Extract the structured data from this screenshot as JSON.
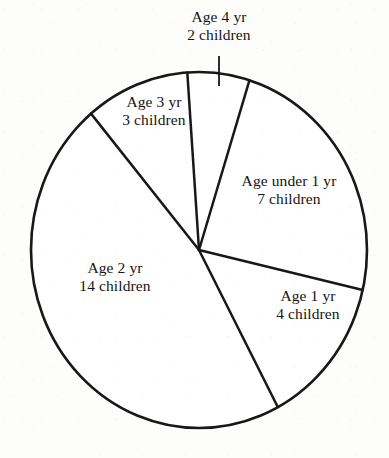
{
  "chart_data": {
    "type": "pie",
    "title": "",
    "subtitle": "",
    "xlabel": "",
    "ylabel": "",
    "legend_position": "none",
    "grid": false,
    "units": "children",
    "total": 30,
    "categories": [
      "Age under 1 yr",
      "Age 1 yr",
      "Age 2 yr",
      "Age 3 yr",
      "Age 4 yr"
    ],
    "values": [
      7,
      4,
      14,
      3,
      2
    ],
    "slices": [
      {
        "id": "under1",
        "category": "Age under 1 yr",
        "value": 7,
        "unit_label": "7 children",
        "name_label": "Age under 1 yr",
        "percent": 23.3,
        "start_angle_deg": 22.0,
        "end_angle_deg": 103.0
      },
      {
        "id": "age1",
        "category": "Age 1 yr",
        "value": 4,
        "unit_label": "4 children",
        "name_label": "Age 1 yr",
        "percent": 13.3,
        "start_angle_deg": -50.0,
        "end_angle_deg": 22.0
      },
      {
        "id": "age2",
        "category": "Age 2 yr",
        "value": 14,
        "unit_label": "14 children",
        "name_label": "Age 2 yr",
        "percent": 46.7,
        "start_angle_deg": -50.0,
        "end_angle_deg": 133.0
      },
      {
        "id": "age3",
        "category": "Age 3 yr",
        "value": 3,
        "unit_label": "3 children",
        "name_label": "Age 3 yr",
        "percent": 10.0,
        "start_angle_deg": 94.0,
        "end_angle_deg": 133.0
      },
      {
        "id": "age4",
        "category": "Age 4 yr",
        "value": 2,
        "unit_label": "2 children",
        "name_label": "Age 4 yr",
        "percent": 6.7,
        "start_angle_deg": 85.0,
        "end_angle_deg": 94.0
      }
    ],
    "colors": {
      "slice_fill": "#ffffff",
      "outline": "#181818",
      "divider": "#181818",
      "background": "#fdfdfc",
      "text": "#141414"
    }
  },
  "labels": {
    "under1": {
      "line1": "Age under 1 yr",
      "line2": "7 children"
    },
    "age1": {
      "line1": "Age 1 yr",
      "line2": "4 children"
    },
    "age2": {
      "line1": "Age 2 yr",
      "line2": "14 children"
    },
    "age3": {
      "line1": "Age 3 yr",
      "line2": "3 children"
    },
    "age4": {
      "line1": "Age 4 yr",
      "line2": "2 children"
    }
  },
  "geometry": {
    "center_x": 199,
    "center_y": 250,
    "radius_x": 168,
    "radius_y": 178
  }
}
